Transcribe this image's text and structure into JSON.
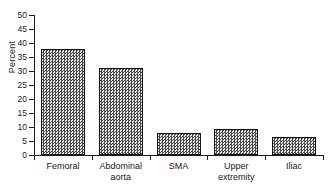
{
  "chart_data": {
    "type": "bar",
    "title": "",
    "subtitle": "",
    "xlabel": "",
    "ylabel": "Percent",
    "categories": [
      "Femoral",
      "Abdominal\naorta",
      "SMA",
      "Upper\nextremity",
      "Iliac"
    ],
    "values": [
      38,
      31,
      8,
      9.2,
      6.5
    ],
    "ylim": [
      0,
      50
    ],
    "yticks": [
      0,
      5,
      10,
      15,
      20,
      25,
      30,
      35,
      40,
      45,
      50
    ],
    "ytick_labels": [
      "0",
      "5",
      "10",
      "15",
      "20",
      "25",
      "30",
      "35",
      "40",
      "45",
      "50"
    ],
    "grid": false,
    "legend": false,
    "legend_position": "none",
    "bar_fill": "#9a9a9a",
    "bar_edge": "#111111",
    "axis_color": "#1a1a1a",
    "background": "#ffffff"
  }
}
